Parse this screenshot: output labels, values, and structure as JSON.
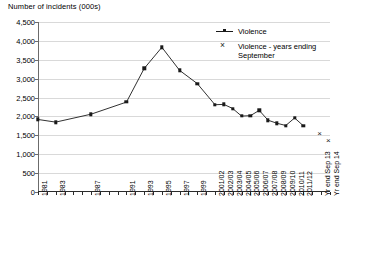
{
  "chart_data": {
    "type": "line",
    "title": "",
    "ylabel": "Number of incidents (000s)",
    "xlabel": "",
    "ylim": [
      0,
      4500
    ],
    "ytick_step": 500,
    "grid": true,
    "legend_position": "top-right",
    "ytick_labels": [
      "0",
      "500",
      "1,000",
      "1,500",
      "2,000",
      "2,500",
      "3,000",
      "3,500",
      "4,000",
      "4,500"
    ],
    "ytick_values": [
      0,
      500,
      1000,
      1500,
      2000,
      2500,
      3000,
      3500,
      4000,
      4500
    ],
    "x_tick_count": 34,
    "categories": [
      "1981",
      "1982",
      "1983",
      "1984",
      "1985",
      "1986",
      "1987",
      "1988",
      "1989",
      "1990",
      "1991",
      "1992",
      "1993",
      "1994",
      "1995",
      "1996",
      "1997",
      "1998",
      "1999",
      "2000",
      "2001/02",
      "2002/03",
      "2003/04",
      "2004/05",
      "2005/06",
      "2006/07",
      "2007/08",
      "2008/09",
      "2009/10",
      "2010/11",
      "2011/12",
      "",
      "Yr end Sep 13",
      "Yr end Sep 14"
    ],
    "visible_tick_labels": [
      {
        "index": 0,
        "label": "1981"
      },
      {
        "index": 2,
        "label": "1983"
      },
      {
        "index": 6,
        "label": "1987"
      },
      {
        "index": 10,
        "label": "1991"
      },
      {
        "index": 12,
        "label": "1993"
      },
      {
        "index": 14,
        "label": "1995"
      },
      {
        "index": 16,
        "label": "1997"
      },
      {
        "index": 18,
        "label": "1999"
      },
      {
        "index": 20,
        "label": "2001/02"
      },
      {
        "index": 21,
        "label": "2002/03"
      },
      {
        "index": 22,
        "label": "2003/04"
      },
      {
        "index": 23,
        "label": "2004/05"
      },
      {
        "index": 24,
        "label": "2005/06"
      },
      {
        "index": 25,
        "label": "2006/07"
      },
      {
        "index": 26,
        "label": "2007/08"
      },
      {
        "index": 27,
        "label": "2008/09"
      },
      {
        "index": 28,
        "label": "2009/10"
      },
      {
        "index": 29,
        "label": "2010/11"
      },
      {
        "index": 30,
        "label": "2011/12"
      },
      {
        "index": 32,
        "label": "Yr end Sep 13"
      },
      {
        "index": 33,
        "label": "Yr end Sep 14"
      }
    ],
    "series": [
      {
        "name": "Violence",
        "marker": "square",
        "line": true,
        "color": "#1a1a1a",
        "points": [
          {
            "x": 0,
            "label": "1981",
            "value": 1920
          },
          {
            "x": 2,
            "label": "1983",
            "value": 1850
          },
          {
            "x": 6,
            "label": "1987",
            "value": 2060
          },
          {
            "x": 10,
            "label": "1991",
            "value": 2380
          },
          {
            "x": 12,
            "label": "1993",
            "value": 3270
          },
          {
            "x": 14,
            "label": "1995",
            "value": 3830
          },
          {
            "x": 16,
            "label": "1997",
            "value": 3220
          },
          {
            "x": 18,
            "label": "1999",
            "value": 2870
          },
          {
            "x": 20,
            "label": "2001/02",
            "value": 2310
          },
          {
            "x": 21,
            "label": "2002/03",
            "value": 2320
          },
          {
            "x": 22,
            "label": "2003/04",
            "value": 2210
          },
          {
            "x": 23,
            "label": "2004/05",
            "value": 2010
          },
          {
            "x": 24,
            "label": "2005/06",
            "value": 2020
          },
          {
            "x": 25,
            "label": "2006/07",
            "value": 2160
          },
          {
            "x": 26,
            "label": "2007/08",
            "value": 1900
          },
          {
            "x": 27,
            "label": "2008/09",
            "value": 1820
          },
          {
            "x": 28,
            "label": "2009/10",
            "value": 1760
          },
          {
            "x": 29,
            "label": "2010/11",
            "value": 1960
          },
          {
            "x": 30,
            "label": "2011/12",
            "value": 1750
          }
        ]
      },
      {
        "name": "Violence - years ending September",
        "marker": "x",
        "line": false,
        "color": "#1a1a1a",
        "points": [
          {
            "x": 32,
            "label": "Yr end Sep 13",
            "value": 1530
          },
          {
            "x": 33,
            "label": "Yr end Sep 14",
            "value": 1340
          }
        ]
      }
    ],
    "legend": [
      {
        "label": "Violence",
        "marker": "square-line"
      },
      {
        "label": "Violence - years ending\nSeptember",
        "marker": "x"
      }
    ]
  }
}
